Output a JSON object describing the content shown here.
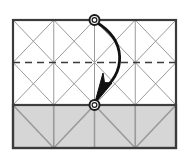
{
  "figure": {
    "kind": "origami-crease-pattern-diagram",
    "title": "Origami fold step diagram",
    "caption": "Bring the top center point down to the center of the shaded band edge.",
    "background_color": "#ffffff"
  },
  "colors": {
    "outline": "#3b3b3b",
    "crease_line": "#9a9a9a",
    "grid_line": "#9a9a9a",
    "dashed_line": "#3b3b3b",
    "shaded_fill": "#d6d6d6",
    "shaded_outline": "#3f3f3f",
    "arrow": "#111111",
    "marker_stroke": "#1a1a1a",
    "marker_fill": "#ffffff",
    "paper_fill": "#ffffff"
  },
  "sheet": {
    "label": "paper-sheet",
    "x": 13,
    "y": 20,
    "width": 163,
    "height": 128,
    "outline_width": 2
  },
  "grid": {
    "vertical_lines_x": [
      53.75,
      94.5,
      135.25
    ],
    "horizontal_lines_y": [
      20,
      105,
      148
    ],
    "columns": 4,
    "line_width": 1
  },
  "dashed_midline": {
    "label": "valley-fold-dashed-line",
    "y": 62.5,
    "x_start": 13,
    "x_end": 176,
    "dash_pattern": "7 5",
    "line_width": 1.6
  },
  "upper_region": {
    "label": "upper-crease-field",
    "y_top": 20,
    "y_bottom": 105,
    "star_centers_x": [
      53.75,
      135.25
    ],
    "star_center_y": 62.5,
    "description": "Two square panels each filled with an eight-point star of creases"
  },
  "shaded_band": {
    "label": "shaded-band",
    "x": 13,
    "y": 105,
    "width": 163,
    "height": 43,
    "fill": "#d6d6d6",
    "pattern": "zigzag-with-verticals",
    "zigzag_vertices": [
      13,
      53.75,
      94.5,
      135.25,
      176
    ]
  },
  "markers": [
    {
      "name": "source-point-marker",
      "cx": 94.5,
      "cy": 20,
      "r_outer": 5,
      "r_inner": 3.2,
      "role": "start of fold motion"
    },
    {
      "name": "target-point-marker",
      "cx": 94.5,
      "cy": 105,
      "r_outer": 5,
      "r_inner": 3.2,
      "role": "end of fold motion"
    }
  ],
  "fold_arrow": {
    "label": "fold-direction-arrow",
    "from_x": 94.5,
    "from_y": 20,
    "to_x": 94.5,
    "to_y": 105,
    "curve_control_x": 128,
    "curve_control_y": 62,
    "stroke_width": 2.6,
    "head_length": 17,
    "head_width": 12,
    "direction": "downward-curved"
  }
}
